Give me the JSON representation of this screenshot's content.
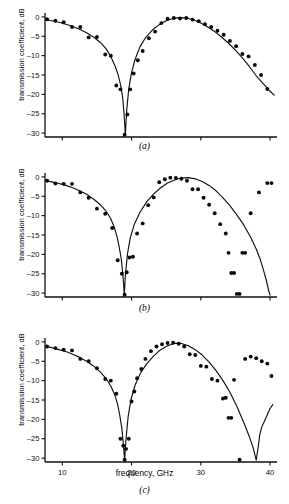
{
  "figure": {
    "axis_title_y": "transmission coefficient, dB",
    "axis_title_x": "frequency, GHz",
    "captions": {
      "a": "(a)",
      "b": "(b)",
      "c": "(c)"
    }
  },
  "chart_data": [
    {
      "type": "line",
      "panel": "a",
      "title": "(a)",
      "xlabel": "frequency, GHz",
      "ylabel": "transmission coefficient, dB",
      "xlim": [
        7.5,
        41
      ],
      "ylim": [
        -31,
        1
      ],
      "xticks": [
        10,
        20,
        30,
        40
      ],
      "yticks": [
        0,
        -5,
        -10,
        -15,
        -20,
        -25,
        -30
      ],
      "grid": false,
      "legend": "none",
      "series": [
        {
          "name": "theory",
          "style": "solid-curve",
          "x": [
            7.6,
            8.5,
            9.5,
            10.5,
            11.5,
            12.5,
            13.5,
            14.5,
            15.5,
            16.3,
            17.0,
            17.6,
            18.0,
            18.4,
            18.7,
            18.9,
            19.0,
            19.1,
            19.3,
            19.6,
            20.0,
            20.5,
            21.2,
            22.0,
            23.0,
            24.0,
            25.0,
            26.0,
            27.0,
            28.0,
            29.0,
            30.0,
            31.0,
            32.0,
            33.0,
            34.0,
            35.0,
            36.0,
            37.0,
            38.0,
            39.0,
            40.0,
            40.6
          ],
          "y": [
            -0.8,
            -1.0,
            -1.4,
            -1.9,
            -2.5,
            -3.2,
            -4.1,
            -5.2,
            -6.6,
            -8.2,
            -10.2,
            -12.6,
            -14.6,
            -17.4,
            -20.6,
            -24.6,
            -27.5,
            -30.5,
            -24.0,
            -18.5,
            -14.4,
            -11.0,
            -7.8,
            -5.4,
            -3.4,
            -2.0,
            -1.0,
            -0.4,
            -0.2,
            -0.3,
            -0.8,
            -1.6,
            -2.6,
            -3.8,
            -5.2,
            -6.8,
            -8.6,
            -10.6,
            -12.8,
            -15.2,
            -17.2,
            -19.2,
            -20.2
          ]
        },
        {
          "name": "measured",
          "style": "points",
          "x": [
            7.8,
            9.0,
            10.2,
            11.4,
            12.6,
            13.8,
            15.0,
            16.2,
            17.0,
            17.8,
            18.4,
            19.0,
            19.4,
            19.8,
            20.3,
            20.9,
            21.6,
            22.5,
            23.4,
            24.3,
            25.2,
            26.1,
            27.0,
            27.9,
            28.8,
            29.7,
            30.6,
            31.5,
            32.4,
            33.3,
            34.2,
            35.1,
            36.0,
            36.9,
            37.8,
            38.7,
            39.6
          ],
          "y": [
            -0.6,
            -1.0,
            -1.4,
            -2.6,
            -2.6,
            -5.3,
            -5.2,
            -9.7,
            -10.0,
            -17.7,
            -18.7,
            -30.5,
            -25.2,
            -18.7,
            -14.6,
            -11.2,
            -8.8,
            -5.5,
            -3.8,
            -1.6,
            -0.5,
            -0.3,
            -0.4,
            -0.3,
            -0.7,
            -1.1,
            -1.9,
            -2.6,
            -3.6,
            -4.6,
            -6.2,
            -7.6,
            -9.6,
            -10.2,
            -12.4,
            -15.0,
            -18.6
          ]
        }
      ]
    },
    {
      "type": "line",
      "panel": "b",
      "title": "(b)",
      "xlabel": "frequency, GHz",
      "ylabel": "transmission coefficient, dB",
      "xlim": [
        7.5,
        41
      ],
      "ylim": [
        -31,
        1
      ],
      "xticks": [
        10,
        20,
        30,
        40
      ],
      "yticks": [
        0,
        -5,
        -10,
        -15,
        -20,
        -25,
        -30
      ],
      "grid": false,
      "legend": "none",
      "series": [
        {
          "name": "theory",
          "style": "solid-curve",
          "x": [
            7.6,
            8.5,
            9.5,
            10.5,
            11.5,
            12.5,
            13.5,
            14.5,
            15.5,
            16.3,
            17.0,
            17.5,
            17.9,
            18.2,
            18.5,
            18.7,
            18.85,
            18.95,
            19.1,
            19.4,
            19.8,
            20.4,
            21.2,
            22.2,
            23.2,
            24.2,
            25.2,
            26.2,
            27.2,
            28.2,
            29.2,
            30.2,
            31.2,
            32.2,
            33.2,
            34.2,
            35.2,
            36.2,
            37.2,
            38.0,
            38.6,
            39.1,
            39.5,
            39.8,
            40.0
          ],
          "y": [
            -1.0,
            -1.3,
            -1.7,
            -2.2,
            -2.8,
            -3.6,
            -4.5,
            -5.7,
            -7.2,
            -8.8,
            -10.8,
            -13.0,
            -15.4,
            -18.0,
            -21.0,
            -24.4,
            -27.6,
            -30.5,
            -25.5,
            -20.0,
            -15.8,
            -12.2,
            -9.2,
            -6.4,
            -4.4,
            -2.8,
            -1.6,
            -0.8,
            -0.3,
            -0.2,
            -0.5,
            -1.2,
            -2.2,
            -3.6,
            -5.4,
            -7.4,
            -9.8,
            -12.4,
            -15.6,
            -18.6,
            -21.4,
            -24.4,
            -27.0,
            -29.4,
            -30.5
          ]
        },
        {
          "name": "measured",
          "style": "points",
          "x": [
            7.8,
            9.0,
            10.2,
            11.4,
            12.6,
            13.8,
            15.0,
            16.2,
            17.2,
            18.0,
            18.6,
            19.0,
            19.3,
            19.7,
            20.2,
            20.8,
            21.6,
            22.4,
            23.2,
            24.0,
            24.8,
            25.6,
            26.4,
            27.2,
            28.0,
            28.8,
            29.6,
            30.4,
            31.2,
            32.0,
            32.8,
            33.6,
            34.0,
            34.4,
            34.8,
            35.2,
            35.6,
            36.0,
            36.4,
            37.2,
            38.4,
            39.6,
            40.2
          ],
          "y": [
            -1.0,
            -1.7,
            -1.8,
            -1.8,
            -4.0,
            -5.4,
            -8.2,
            -9.5,
            -13.2,
            -21.5,
            -25.0,
            -30.5,
            -24.6,
            -20.8,
            -20.6,
            -14.6,
            -12.0,
            -7.3,
            -5.3,
            -1.4,
            -0.6,
            -0.2,
            -0.3,
            -0.5,
            -1.0,
            -3.2,
            -3.2,
            -5.4,
            -7.2,
            -9.4,
            -12.2,
            -14.6,
            -19.6,
            -24.8,
            -24.8,
            -30.2,
            -30.2,
            -19.6,
            -19.6,
            -9.4,
            -4.0,
            -1.6,
            -1.6
          ]
        }
      ]
    },
    {
      "type": "line",
      "panel": "c",
      "title": "(c)",
      "xlabel": "frequency, GHz",
      "ylabel": "transmission coefficient, dB",
      "xlim": [
        7.5,
        41
      ],
      "ylim": [
        -31,
        1
      ],
      "xticks": [
        10,
        20,
        30,
        40
      ],
      "yticks": [
        0,
        -5,
        -10,
        -15,
        -20,
        -25,
        -30
      ],
      "grid": false,
      "legend": "none",
      "series": [
        {
          "name": "theory",
          "style": "solid-curve",
          "x": [
            7.6,
            8.5,
            9.5,
            10.5,
            11.5,
            12.5,
            13.5,
            14.5,
            15.5,
            16.3,
            17.0,
            17.6,
            18.0,
            18.3,
            18.6,
            18.8,
            18.9,
            19.0,
            19.2,
            19.5,
            19.9,
            20.5,
            21.3,
            22.2,
            23.2,
            24.2,
            25.2,
            26.2,
            27.2,
            28.2,
            29.2,
            30.2,
            31.2,
            32.2,
            33.2,
            34.2,
            35.2,
            36.2,
            37.0,
            37.6,
            38.0,
            38.3,
            38.5,
            38.8,
            39.2,
            39.6,
            40.0,
            40.4
          ],
          "y": [
            -1.2,
            -1.5,
            -2.0,
            -2.5,
            -3.2,
            -4.0,
            -5.0,
            -6.2,
            -7.8,
            -9.4,
            -11.4,
            -13.8,
            -16.2,
            -19.0,
            -22.4,
            -26.2,
            -28.4,
            -30.5,
            -25.0,
            -19.4,
            -15.0,
            -11.2,
            -8.0,
            -5.6,
            -3.6,
            -2.0,
            -1.0,
            -0.4,
            -0.4,
            -1.0,
            -2.0,
            -3.4,
            -5.2,
            -7.4,
            -10.0,
            -13.0,
            -16.6,
            -20.8,
            -24.4,
            -27.6,
            -30.5,
            -27.0,
            -24.0,
            -22.0,
            -20.4,
            -18.8,
            -17.2,
            -16.2
          ]
        },
        {
          "name": "measured",
          "style": "points",
          "x": [
            7.8,
            9.0,
            10.2,
            11.4,
            12.6,
            13.8,
            15.0,
            16.2,
            17.0,
            17.8,
            18.4,
            18.8,
            19.0,
            19.2,
            19.6,
            20.0,
            20.4,
            20.8,
            21.4,
            22.0,
            22.8,
            23.6,
            24.4,
            25.2,
            26.0,
            26.8,
            27.6,
            28.4,
            29.2,
            30.0,
            30.8,
            31.6,
            32.4,
            33.2,
            33.6,
            34.0,
            34.4,
            34.8,
            35.6,
            36.4,
            37.2,
            38.0,
            38.8,
            39.6,
            40.2
          ],
          "y": [
            -1.2,
            -1.6,
            -2.0,
            -2.2,
            -4.4,
            -5.0,
            -6.8,
            -9.6,
            -10.0,
            -13.4,
            -25.0,
            -26.8,
            -30.4,
            -27.6,
            -25.0,
            -15.4,
            -12.8,
            -9.4,
            -7.0,
            -4.4,
            -2.4,
            -1.2,
            -0.6,
            -0.3,
            -0.2,
            -0.5,
            -1.2,
            -3.2,
            -3.4,
            -6.2,
            -6.4,
            -9.6,
            -10.0,
            -14.6,
            -14.4,
            -19.6,
            -19.6,
            -9.8,
            -30.4,
            -4.4,
            -3.8,
            -4.2,
            -5.0,
            -5.6,
            -8.8
          ]
        }
      ]
    }
  ]
}
